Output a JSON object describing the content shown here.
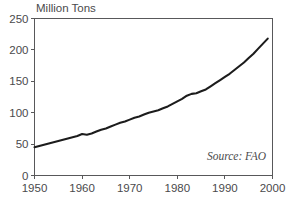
{
  "chart_data": {
    "type": "line",
    "title": "Million Tons",
    "xlabel": "",
    "ylabel": "",
    "annotation": "Source: FAO",
    "grid": false,
    "legend": false,
    "line_color": "#1c1c1c",
    "axis_color": "#58585a",
    "background": "#ffffff",
    "xlim": [
      1950,
      2000
    ],
    "ylim": [
      0,
      250
    ],
    "xticks": [
      1950,
      1960,
      1970,
      1980,
      1990,
      2000
    ],
    "xtick_labels": [
      "1950",
      "1960",
      "1970",
      "1980",
      "1990",
      "2000"
    ],
    "yticks": [
      0,
      50,
      100,
      150,
      200,
      250
    ],
    "ytick_labels": [
      "0",
      "50",
      "100",
      "150",
      "200",
      "250"
    ],
    "x": [
      1950,
      1951,
      1952,
      1953,
      1954,
      1955,
      1956,
      1957,
      1958,
      1959,
      1960,
      1961,
      1962,
      1963,
      1964,
      1965,
      1966,
      1967,
      1968,
      1969,
      1970,
      1971,
      1972,
      1973,
      1974,
      1975,
      1976,
      1977,
      1978,
      1979,
      1980,
      1981,
      1982,
      1983,
      1984,
      1985,
      1986,
      1987,
      1988,
      1989,
      1990,
      1991,
      1992,
      1993,
      1994,
      1995,
      1996,
      1997,
      1998,
      1999
    ],
    "values": [
      45,
      47,
      49,
      51,
      53,
      55,
      57,
      59,
      61,
      63,
      66,
      65,
      67,
      70,
      73,
      75,
      78,
      81,
      84,
      86,
      89,
      92,
      94,
      97,
      100,
      102,
      104,
      107,
      110,
      114,
      118,
      122,
      127,
      130,
      131,
      134,
      137,
      142,
      147,
      152,
      157,
      162,
      168,
      174,
      180,
      187,
      194,
      202,
      210,
      218
    ]
  },
  "axis_title": "Million Tons",
  "source_label": "Source: FAO"
}
